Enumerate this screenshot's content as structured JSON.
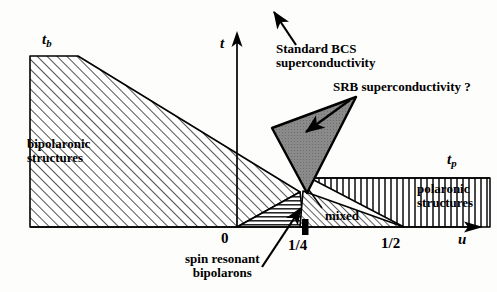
{
  "figure": {
    "type": "phase-diagram",
    "background_color": "#fdfdfb",
    "line_color": "#000000",
    "wedge_fill_color": "#8a8a8a"
  },
  "axes": {
    "y_axis_label": "t",
    "x_axis_label": "u",
    "x_ticks": [
      {
        "label": "0",
        "value": 0
      },
      {
        "label": "1/4",
        "value": 0.25
      },
      {
        "label": "1/2",
        "value": 0.5
      }
    ],
    "y_markers": [
      {
        "label": "t",
        "sub": "b"
      },
      {
        "label": "t",
        "sub": "p"
      }
    ]
  },
  "regions": [
    {
      "name": "bipolaronic-structures",
      "label_line1": "bipolaronic",
      "label_line2": "structures",
      "hatch": "diagonal"
    },
    {
      "name": "spin-resonant-bipolarons",
      "label_line1": "spin resonant",
      "label_line2": "bipolarons",
      "hatch": "horizontal"
    },
    {
      "name": "mixed",
      "label_line1": "mixed",
      "hatch": "diagonal-fine"
    },
    {
      "name": "polaronic-structures",
      "label_line1": "polaronic",
      "label_line2": "structures",
      "hatch": "vertical"
    }
  ],
  "annotations": [
    {
      "name": "standard-bcs",
      "line1": "Standard BCS",
      "line2": "superconductivity"
    },
    {
      "name": "srb",
      "line1": "SRB superconductivity ?"
    }
  ]
}
